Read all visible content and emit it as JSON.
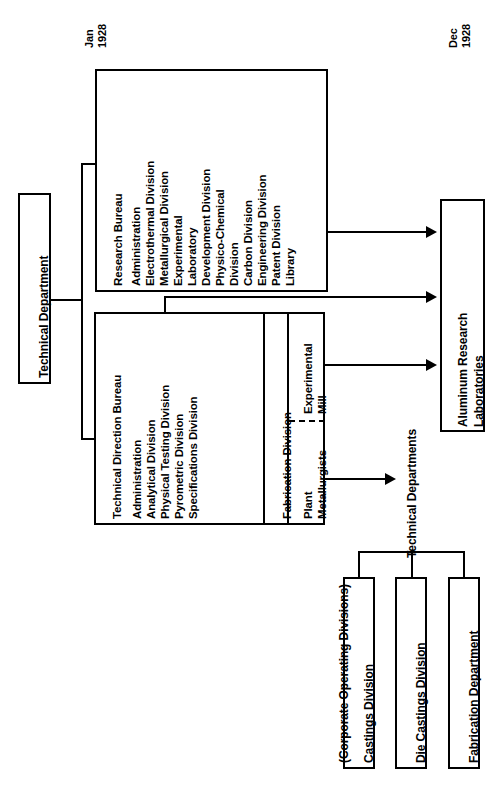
{
  "chart": {
    "dates": {
      "left": "Jan\n1928",
      "left_line1": "Jan",
      "left_line2": "1928",
      "right_line1": "Dec",
      "right_line2": "1928"
    },
    "root": {
      "label": "Technical Department"
    },
    "bureaus": [
      {
        "name": "research-bureau",
        "title": "Research Bureau",
        "items": [
          "Administration",
          "Electrothermal Division",
          "Metallurgical Division",
          "Experimental",
          "Laboratory",
          "Development Division",
          "Physico-Chemical",
          "Division",
          "Carbon Division",
          "Engineering Division",
          "Patent Division",
          "Library"
        ]
      },
      {
        "name": "technical-direction-bureau",
        "title": "Technical Direction Bureau",
        "items": [
          "Administration",
          "Analytical Division",
          "Physical Testing Division",
          "Pyrometric Division",
          "Specifications Division"
        ]
      }
    ],
    "fabrication": {
      "title": "Fabrication Division",
      "subcells": [
        {
          "name": "experimental-mill",
          "line1": "Experimental",
          "line2": "Mill"
        },
        {
          "name": "plant-metallurgists",
          "line1": "Plant",
          "line2": "Metallurgists"
        }
      ]
    },
    "targets": {
      "aluminum_research_labs": {
        "line1": "Aluminum Research",
        "line2": "Laboratories"
      },
      "technical_departments": "Technical Departments",
      "corporate_note": "(Corporate Operating Divisions)"
    },
    "operating_divisions": [
      "Castings Division",
      "Die Castings Division",
      "Fabrication Department"
    ],
    "colors": {
      "stroke": "#000000",
      "background": "#ffffff",
      "text": "#000000"
    }
  }
}
